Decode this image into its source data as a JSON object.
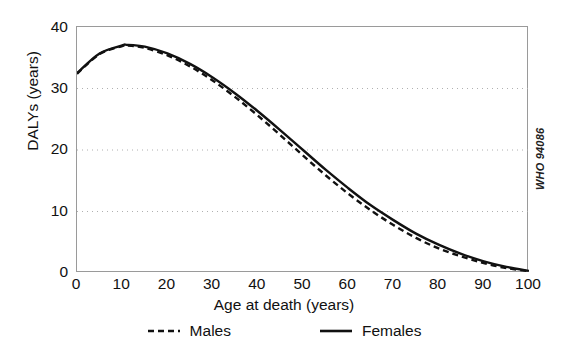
{
  "figure": {
    "who_code": "WHO 94086",
    "background_color": "#ffffff",
    "frame_color": "#9a9a9a",
    "gridline_color": "#b0b0b0",
    "series_color": "#111111"
  },
  "chart_data": {
    "type": "line",
    "title": "",
    "xlabel": "Age at death (years)",
    "ylabel": "DALYs (years)",
    "xlim": [
      0,
      100
    ],
    "ylim": [
      0,
      40
    ],
    "xticks": [
      0,
      10,
      20,
      30,
      40,
      50,
      60,
      70,
      80,
      90,
      100
    ],
    "xtick_labels": [
      "0",
      "10",
      "20",
      "30",
      "40",
      "50",
      "60",
      "70",
      "80",
      "90",
      "100"
    ],
    "yticks": [
      0,
      10,
      20,
      30,
      40
    ],
    "ytick_labels": [
      "0",
      "10",
      "20",
      "30",
      "40"
    ],
    "grid": "horizontal-dotted",
    "gridlines_at": [
      10,
      20,
      30
    ],
    "legend_position": "below",
    "x": [
      0,
      5,
      10,
      11,
      15,
      20,
      25,
      30,
      35,
      40,
      45,
      50,
      55,
      60,
      65,
      70,
      75,
      80,
      85,
      90,
      95,
      100
    ],
    "series": [
      {
        "name": "Males",
        "style": "dashed",
        "values": [
          32.4,
          35.6,
          36.9,
          37.0,
          36.6,
          35.4,
          33.6,
          31.3,
          28.6,
          25.6,
          22.4,
          19.1,
          15.9,
          12.9,
          10.2,
          7.8,
          5.7,
          4.0,
          2.7,
          1.6,
          0.8,
          0.3
        ]
      },
      {
        "name": "Females",
        "style": "solid",
        "values": [
          32.5,
          35.7,
          37.0,
          37.1,
          36.8,
          35.7,
          34.0,
          31.8,
          29.2,
          26.3,
          23.2,
          20.0,
          16.8,
          13.8,
          11.0,
          8.6,
          6.4,
          4.6,
          3.1,
          1.9,
          1.0,
          0.35
        ]
      }
    ]
  },
  "legend": {
    "items": [
      {
        "label": "Males",
        "style": "dashed"
      },
      {
        "label": "Females",
        "style": "solid"
      }
    ]
  }
}
